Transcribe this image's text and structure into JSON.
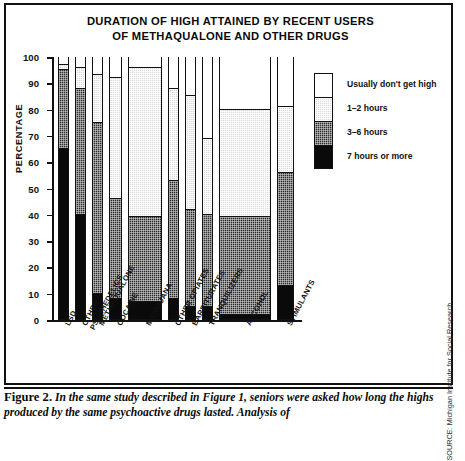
{
  "chart_data": {
    "type": "bar",
    "subtype": "stacked-bar-100",
    "title": "DURATION OF HIGH ATTAINED BY RECENT USERS OF METHAQUALONE AND OTHER DRUGS",
    "title_lines": [
      "DURATION OF HIGH ATTAINED BY RECENT USERS",
      "OF METHAQUALONE AND OTHER DRUGS"
    ],
    "xlabel": "",
    "ylabel": "PERCENTAGE",
    "ylim": [
      0,
      100
    ],
    "yticks": [
      0,
      10,
      20,
      30,
      40,
      50,
      60,
      70,
      80,
      90,
      100
    ],
    "grid": false,
    "legend_position": "right",
    "categories": [
      "LSD",
      "OTHER PSYCHEDELICS",
      "METHAQUALONE",
      "COCAINE",
      "MARIJUANA",
      "OTHER OPIATES",
      "BARBITURATES",
      "TRANQUILIZERS",
      "ALCOHOL",
      "STIMULANTS"
    ],
    "category_label_lines": [
      [
        "LSD"
      ],
      [
        "OTHER",
        "PSYCHEDELICS"
      ],
      [
        "METHAQUALONE"
      ],
      [
        "COCAINE"
      ],
      [
        "MARIJUANA"
      ],
      [
        "OTHER OPIATES"
      ],
      [
        "BARBITURATES"
      ],
      [
        "TRANQUILIZERS"
      ],
      [
        "ALCOHOL"
      ],
      [
        "STIMULANTS"
      ]
    ],
    "series": [
      {
        "name": "7 hours or more",
        "color": "#0a0a0a",
        "values": [
          65,
          40,
          10,
          8,
          7,
          8,
          5,
          5,
          2,
          13
        ]
      },
      {
        "name": "3–6 hours",
        "color": "#2b2b2b",
        "values": [
          30,
          48,
          65,
          38,
          32,
          45,
          37,
          35,
          37,
          43
        ]
      },
      {
        "name": "1–2 hours",
        "color": "#d9d9d9",
        "values": [
          2,
          8,
          18,
          46,
          57,
          35,
          43,
          29,
          41,
          25
        ]
      },
      {
        "name": "Usually don't get high",
        "color": "#ffffff",
        "values": [
          3,
          4,
          7,
          8,
          4,
          12,
          15,
          31,
          20,
          19
        ]
      }
    ],
    "bar_widths_px": [
      11,
      11,
      11,
      13,
      34,
      11,
      11,
      11,
      52,
      17
    ]
  },
  "legend": {
    "items": [
      {
        "label": "Usually don't get high",
        "swatch": "white"
      },
      {
        "label": "1–2 hours",
        "swatch": "light"
      },
      {
        "label": "3–6 hours",
        "swatch": "dark"
      },
      {
        "label": "7 hours or more",
        "swatch": "black"
      }
    ]
  },
  "source": {
    "text": "SOURCE: Michigan Institute for Social Research"
  },
  "caption": {
    "figure_number": "Figure 2.",
    "body": "In the same study described in Figure 1, seniors were asked how long the highs produced by the same psychoactive drugs lasted. Analysis of"
  }
}
